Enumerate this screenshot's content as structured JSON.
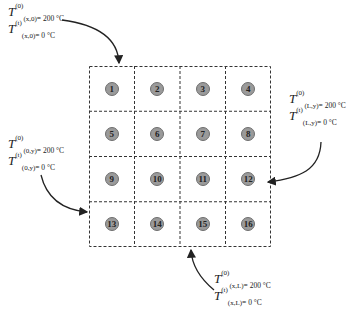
{
  "diagram": {
    "grid": {
      "rows": 4,
      "cols": 4,
      "line_style": "dashed",
      "node_color": "#9a9a9a",
      "nodes": [
        "1",
        "2",
        "3",
        "4",
        "5",
        "6",
        "7",
        "8",
        "9",
        "10",
        "11",
        "12",
        "13",
        "14",
        "15",
        "16"
      ]
    },
    "boundary_labels": {
      "top": {
        "line1": {
          "symbol": "T",
          "sup": "(0)",
          "sub": "(x,0)",
          "value": "= 200 °C"
        },
        "line2": {
          "symbol": "T",
          "sup": "(t)",
          "sub": "(x,0)",
          "value": "= 0 °C"
        },
        "arrow_target_node": "1"
      },
      "right": {
        "line1": {
          "symbol": "T",
          "sup": "(0)",
          "sub": "(L,y)",
          "value": "= 200 °C"
        },
        "line2": {
          "symbol": "T",
          "sup": "(t)",
          "sub": "(L,y)",
          "value": "= 0 °C"
        },
        "arrow_target_node": "12"
      },
      "left": {
        "line1": {
          "symbol": "T",
          "sup": "(0)",
          "sub": "(0,y)",
          "value": "= 200 °C"
        },
        "line2": {
          "symbol": "T",
          "sup": "(t)",
          "sub": "(0,y)",
          "value": "= 0 °C"
        },
        "arrow_target_node": "13"
      },
      "bottom": {
        "line1": {
          "symbol": "T",
          "sup": "(0)",
          "sub": "(x,L)",
          "value": "= 200 °C"
        },
        "line2": {
          "symbol": "T",
          "sup": "(t)",
          "sub": "(x,L)",
          "value": "= 0 °C"
        },
        "arrow_target_node": "15"
      }
    }
  }
}
